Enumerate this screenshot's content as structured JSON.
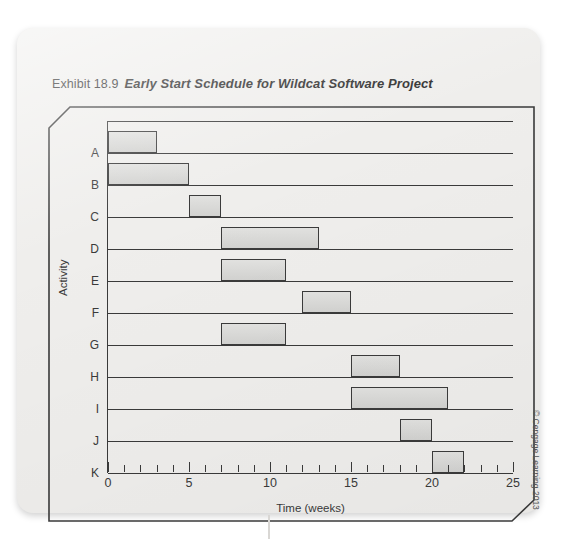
{
  "title": {
    "exhibit": "Exhibit 18.9",
    "caption": "Early Start Schedule for Wildcat Software Project"
  },
  "credit": "© Cengage Learning 2013",
  "chart_data": {
    "type": "bar",
    "orientation": "horizontal",
    "subtype": "gantt",
    "title": "Early Start Schedule for Wildcat Software Project",
    "xlabel": "Time (weeks)",
    "ylabel": "Activity",
    "xlim": [
      0,
      25
    ],
    "xticks": [
      0,
      5,
      10,
      15,
      20,
      25
    ],
    "xtick_labels": [
      "0",
      "5",
      "10",
      "15",
      "20",
      "25"
    ],
    "minor_tick_interval": 1,
    "grid": false,
    "legend": "none",
    "bar_fill": "#d8d8d6",
    "bar_stroke": "#3b3b3b",
    "categories": [
      "A",
      "B",
      "C",
      "D",
      "E",
      "F",
      "G",
      "H",
      "I",
      "J",
      "K"
    ],
    "tasks": [
      {
        "activity": "A",
        "start": 0,
        "end": 3,
        "duration": 3
      },
      {
        "activity": "B",
        "start": 0,
        "end": 5,
        "duration": 5
      },
      {
        "activity": "C",
        "start": 5,
        "end": 7,
        "duration": 2
      },
      {
        "activity": "D",
        "start": 7,
        "end": 13,
        "duration": 6
      },
      {
        "activity": "E",
        "start": 7,
        "end": 11,
        "duration": 4
      },
      {
        "activity": "F",
        "start": 12,
        "end": 15,
        "duration": 3
      },
      {
        "activity": "G",
        "start": 7,
        "end": 11,
        "duration": 4
      },
      {
        "activity": "H",
        "start": 15,
        "end": 18,
        "duration": 3
      },
      {
        "activity": "I",
        "start": 15,
        "end": 21,
        "duration": 6
      },
      {
        "activity": "J",
        "start": 18,
        "end": 20,
        "duration": 2
      },
      {
        "activity": "K",
        "start": 20,
        "end": 22,
        "duration": 2
      }
    ]
  }
}
